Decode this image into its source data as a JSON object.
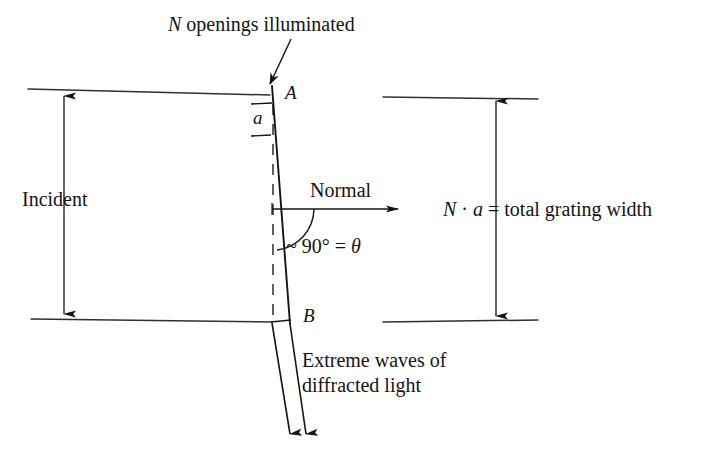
{
  "figure": {
    "background_color": "#ffffff",
    "ink_color": "#141414",
    "width": 728,
    "height": 462
  },
  "labels": {
    "n_openings": "N openings illuminated",
    "incident": "Incident",
    "slit_spacing": "a",
    "point_a": "A",
    "point_b": "B",
    "normal": "Normal",
    "theta": "~ 90° = θ",
    "grating_width": "N · a = total grating width",
    "extreme_waves": "Extreme waves of\ndiffracted light"
  },
  "annotations": {
    "angle_symbol": "θ",
    "angle_value": "~ 90°",
    "dot_operator": "·",
    "degree_symbol": "°"
  },
  "geometry": {
    "incident_top_line": {
      "x1": 28,
      "y1": 89,
      "x2": 270,
      "y2": 95
    },
    "incident_bottom_line": {
      "x1": 31,
      "y1": 319,
      "x2": 272,
      "y2": 322
    },
    "incident_arrow": {
      "x": 64,
      "y_top": 92,
      "y_bottom": 318
    },
    "grating_top_line": {
      "x1": 383,
      "y1": 97,
      "x2": 538,
      "y2": 99
    },
    "grating_bottom_line": {
      "x1": 383,
      "y1": 322,
      "x2": 538,
      "y2": 320
    },
    "grating_width_arrow": {
      "x": 496,
      "y_top": 97,
      "y_bottom": 320
    },
    "grating_plane_dashed": {
      "x": 273,
      "y_top": 104,
      "y_bottom": 318
    },
    "ray_ab": {
      "x1": 272,
      "y1": 88,
      "x2": 289,
      "y2": 322
    },
    "normal_arrow": {
      "x1": 272,
      "y1": 209,
      "x2": 402,
      "y2": 209
    },
    "angle_arc_radius": 42,
    "diffracted_ray_1": {
      "x1": 272,
      "y1": 322,
      "x2": 290,
      "y2": 441
    },
    "diffracted_ray_2": {
      "x1": 289,
      "y1": 322,
      "x2": 305,
      "y2": 441
    },
    "pointer_arrow": {
      "x1": 290,
      "y1": 40,
      "x2": 267,
      "y2": 88
    },
    "spacing_tick_top": {
      "x1": 250,
      "y1": 104,
      "x2": 271,
      "y2": 104
    },
    "spacing_tick_bottom": {
      "x1": 250,
      "y1": 135,
      "x2": 271,
      "y2": 135
    },
    "b_tick": {
      "x1": 272,
      "y1": 322,
      "x2": 290,
      "y2": 320
    }
  }
}
